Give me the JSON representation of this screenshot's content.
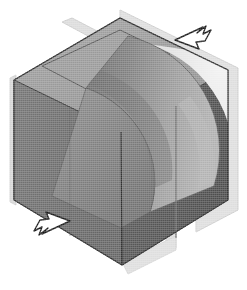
{
  "figure": {
    "title": "Isometric solid block with quarter-round concave cut",
    "description": "Grayscale halftone technical illustration of a cube-like solid in isometric projection. A quarter-cylindrical concave surface is cut from the body. Two translucent section planes pass through the solid. Two hand-drawn arrow pointers annotate the upper-right and lower-left.",
    "background_color": "#ffffff",
    "render_style": "halftone-dither-scan"
  },
  "palette": {
    "top_face": "#9b9b9b",
    "top_face_step": "#8e8e8e",
    "left_face": "#6f6f6f",
    "left_face_dark": "#606060",
    "right_face": "#5a5a5a",
    "right_face_dark": "#4e4e4e",
    "concave_surface_light": "#a6a6a6",
    "concave_surface_mid": "#8a8a8a",
    "concave_surface_dark": "#747474",
    "inner_floor": "#7d7d7d",
    "section_plane": "#dcdcdc",
    "section_plane_edge": "#c4c4c4",
    "highlight_wedge": "#e8e8e8",
    "outline": "#3a3a3a",
    "arrow_stroke": "#1c1c1c",
    "arrow_fill": "#ffffff",
    "paper": "#ffffff"
  },
  "geometry": {
    "projection": "isometric",
    "vertices": {
      "top_apex": [
        120,
        18
      ],
      "left_vertex": [
        14,
        80
      ],
      "right_vertex": [
        228,
        152
      ],
      "bottom_vertex": [
        122,
        265
      ],
      "left_bottom": [
        14,
        200
      ],
      "right_top": [
        228,
        70
      ],
      "center": [
        121,
        142
      ]
    },
    "cut_type": "quarter-cylinder-concave",
    "cut_radius": 96
  },
  "section_planes": [
    {
      "name": "vertical-section-plane-front",
      "opacity": 0.55,
      "color": "#dcdcdc"
    },
    {
      "name": "vertical-section-plane-side",
      "opacity": 0.55,
      "color": "#dcdcdc"
    }
  ],
  "annotations": [
    {
      "id": "arrow-upper-right",
      "shape": "hand-drawn-arrow",
      "direction": "points-down-left",
      "position": [
        170,
        22
      ],
      "size": [
        44,
        30
      ],
      "fill": "#ffffff",
      "stroke": "#1c1c1c",
      "label": ""
    },
    {
      "id": "arrow-lower-left",
      "shape": "hand-drawn-arrow",
      "direction": "points-up-right",
      "position": [
        28,
        218
      ],
      "size": [
        44,
        30
      ],
      "fill": "#ffffff",
      "stroke": "#1c1c1c",
      "label": ""
    }
  ],
  "labels": {
    "figure_caption": "",
    "alt_text": "Isometric cube with concave quarter-cylindrical cut and two section planes, annotated by two arrows."
  }
}
